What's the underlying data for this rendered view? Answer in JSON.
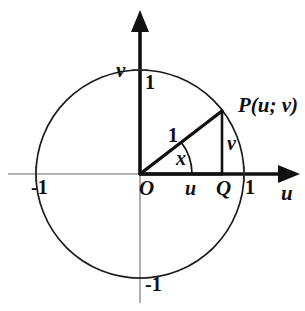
{
  "figure": {
    "colors": {
      "stroke": "#111111",
      "axis_guide": "#8a8a8a",
      "background": "#ffffff"
    },
    "geometry": {
      "origin": {
        "x": 140,
        "y": 174
      },
      "radius": 104,
      "point_P": {
        "x": 222,
        "y": 111
      },
      "point_Q": {
        "x": 222,
        "y": 174
      },
      "angle_x_degrees": 38,
      "u_value": 0.79,
      "v_value": 0.61
    },
    "labels": {
      "axis_vertical": "v",
      "axis_horizontal": "u",
      "tick_top": "1",
      "tick_bottom": "-1",
      "tick_left": "-1",
      "tick_right": "1",
      "point_label": "P(u; v)",
      "origin_label": "O",
      "foot_label": "Q",
      "hypotenuse_label": "1",
      "leg_vertical_label": "v",
      "segment_horizontal_label": "u",
      "angle_label": "x"
    }
  }
}
